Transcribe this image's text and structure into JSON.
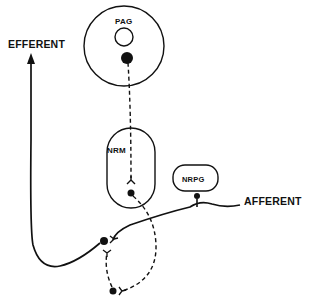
{
  "diagram": {
    "labels": {
      "efferent": "EFFERENT",
      "afferent": "AFFERENT",
      "pag": "PAG",
      "nrm": "NRM",
      "nrpg": "NRPG"
    },
    "colors": {
      "stroke": "#111111",
      "background": "#ffffff"
    },
    "nodes": [
      {
        "id": "PAG",
        "shape": "circle"
      },
      {
        "id": "NRM",
        "shape": "rounded-oval"
      },
      {
        "id": "NRPG",
        "shape": "rounded-rect"
      }
    ],
    "pathways": [
      {
        "from": "PAG",
        "to": "NRM",
        "style": "dashed"
      },
      {
        "from": "NRM",
        "to": "spinal-interneuron",
        "style": "dashed"
      },
      {
        "from": "afferent",
        "to": "NRPG",
        "style": "solid"
      },
      {
        "from": "afferent",
        "to": "efferent",
        "style": "solid"
      }
    ]
  }
}
